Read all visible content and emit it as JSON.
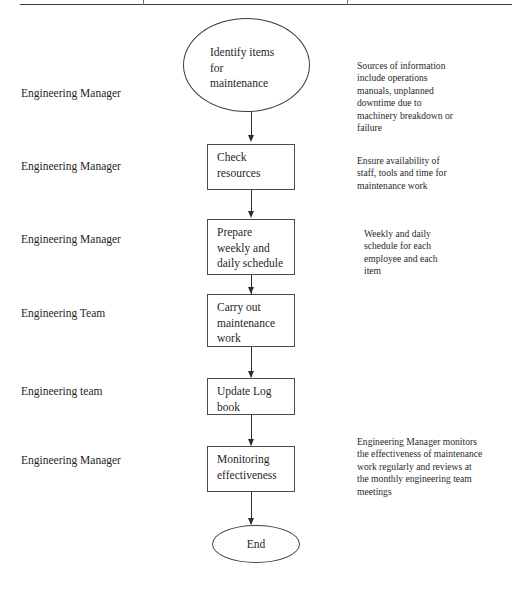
{
  "document": {
    "title": "Maintenance Flowchart",
    "rule_color": "#3c3c3c",
    "line_color": "#2e2e2e",
    "shape_border_color": "#4a4a4a",
    "text_color": "#1f1f1f",
    "background_color": "#ffffff"
  },
  "roles": [
    {
      "label": "Engineering Manager"
    },
    {
      "label": "Engineering Manager"
    },
    {
      "label": "Engineering Manager"
    },
    {
      "label": "Engineering Team"
    },
    {
      "label": "Engineering team"
    },
    {
      "label": "Engineering Manager"
    }
  ],
  "nodes": [
    {
      "id": "identify-items",
      "shape": "ellipse",
      "lines": [
        "Identify items",
        "for",
        "maintenance"
      ]
    },
    {
      "id": "check-resources",
      "shape": "process",
      "lines": [
        "Check",
        "resources"
      ]
    },
    {
      "id": "prepare-schedule",
      "shape": "process",
      "lines": [
        "Prepare",
        "weekly and",
        "daily schedule"
      ]
    },
    {
      "id": "carry-out-maintenance",
      "shape": "process",
      "lines": [
        "Carry out",
        "maintenance",
        "work"
      ]
    },
    {
      "id": "update-log-book",
      "shape": "process",
      "lines": [
        "Update Log",
        "book"
      ]
    },
    {
      "id": "monitoring-effectiveness",
      "shape": "process",
      "lines": [
        "Monitoring",
        "effectiveness"
      ]
    },
    {
      "id": "end",
      "shape": "ellipse",
      "lines": [
        "End"
      ]
    }
  ],
  "notes": [
    {
      "id": "note-sources",
      "lines": [
        "Sources of information",
        "include operations",
        "manuals, unplanned",
        "downtime due to",
        "machinery breakdown or",
        "failure"
      ]
    },
    {
      "id": "note-availability",
      "lines": [
        "Ensure availability of",
        "staff, tools and time for",
        "maintenance work"
      ]
    },
    {
      "id": "note-schedule",
      "lines": [
        "Weekly and daily",
        "schedule for each",
        "employee and each",
        "item"
      ]
    },
    {
      "id": "note-monitoring",
      "lines": [
        "Engineering Manager monitors",
        "the effectiveness of maintenance",
        "work regularly and reviews at",
        "the monthly engineering team",
        "meetings"
      ]
    }
  ]
}
